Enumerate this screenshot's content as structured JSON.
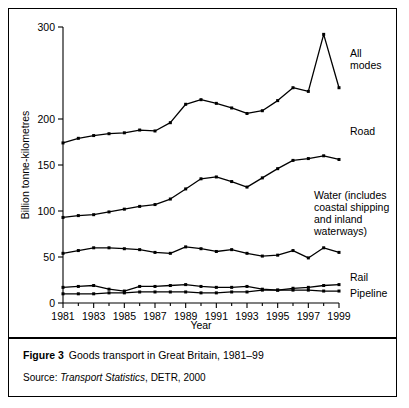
{
  "figure": {
    "label": "Figure 3",
    "caption": "Goods transport in Great Britain, 1981–99",
    "source_prefix": "Source:",
    "source_title": "Transport Statistics",
    "source_rest": ", DETR, 2000"
  },
  "chart_data": {
    "type": "line",
    "title": "Goods transport in Great Britain, 1981–99",
    "xlabel": "Year",
    "ylabel": "Billion tonne-kilometres",
    "xlim": [
      1981,
      1999
    ],
    "ylim": [
      0,
      300
    ],
    "yticks": [
      0,
      50,
      100,
      150,
      200,
      300
    ],
    "ytick_labels": [
      "0",
      "50",
      "100",
      "150",
      "200",
      "300"
    ],
    "xticks": [
      1981,
      1983,
      1985,
      1987,
      1989,
      1991,
      1993,
      1995,
      1997,
      1999
    ],
    "xtick_labels": [
      "1981",
      "1983",
      "1985",
      "1987",
      "1989",
      "1991",
      "1993",
      "1995",
      "1997",
      "1999"
    ],
    "x_minor_ticks": [
      1982,
      1984,
      1986,
      1988,
      1990,
      1992,
      1994,
      1996,
      1998
    ],
    "grid": false,
    "legend_position": "right-inline-labels",
    "x": [
      1981,
      1982,
      1983,
      1984,
      1985,
      1986,
      1987,
      1988,
      1989,
      1990,
      1991,
      1992,
      1993,
      1994,
      1995,
      1996,
      1997,
      1998,
      1999
    ],
    "series": [
      {
        "name": "All modes",
        "label": "All\nmodes",
        "label_lines": [
          "All",
          "modes"
        ],
        "values": [
          174,
          179,
          182,
          184,
          185,
          188,
          187,
          196,
          216,
          221,
          217,
          212,
          206,
          209,
          220,
          234,
          230,
          292,
          234
        ]
      },
      {
        "name": "Road",
        "label": "Road",
        "label_lines": [
          "Road"
        ],
        "values": [
          93,
          95,
          96,
          99,
          102,
          105,
          107,
          113,
          124,
          135,
          137,
          132,
          126,
          136,
          146,
          155,
          157,
          160,
          156
        ]
      },
      {
        "name": "Water (includes coastal shipping and inland waterways)",
        "label": "Water (includes coastal shipping and inland waterways)",
        "label_lines": [
          "Water (includes",
          "coastal shipping",
          "and inland",
          "waterways)"
        ],
        "values": [
          54,
          57,
          60,
          60,
          59,
          58,
          55,
          54,
          61,
          59,
          56,
          58,
          54,
          51,
          52,
          57,
          49,
          60,
          55
        ]
      },
      {
        "name": "Rail",
        "label": "Rail",
        "label_lines": [
          "Rail"
        ],
        "values": [
          17,
          18,
          19,
          15,
          13,
          18,
          18,
          19,
          20,
          18,
          17,
          17,
          18,
          15,
          14,
          16,
          17,
          19,
          20
        ]
      },
      {
        "name": "Pipeline",
        "label": "Pipeline",
        "label_lines": [
          "Pipeline"
        ],
        "values": [
          10,
          10,
          10,
          11,
          11,
          12,
          12,
          12,
          12,
          11,
          11,
          12,
          12,
          14,
          14,
          14,
          14,
          13,
          13
        ]
      }
    ]
  }
}
